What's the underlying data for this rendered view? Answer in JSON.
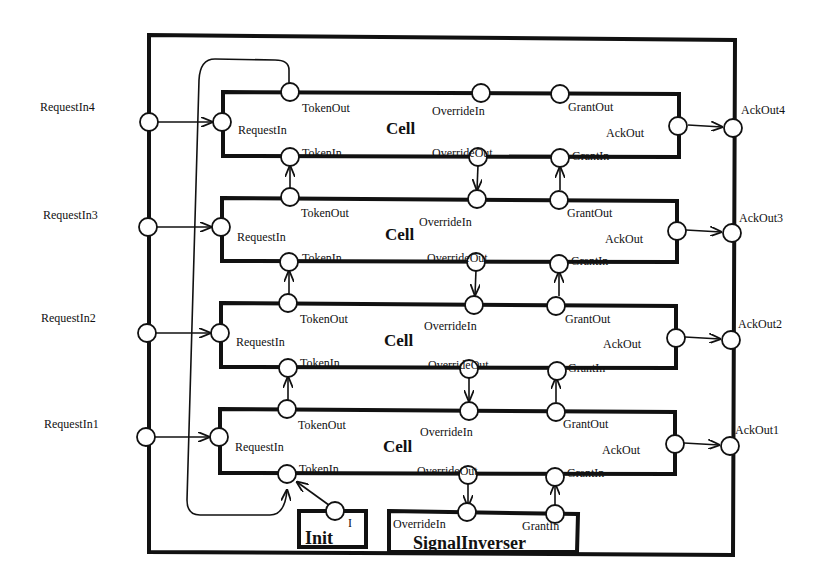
{
  "diagram": {
    "outer_ports_left": [
      "RequestIn4",
      "RequestIn3",
      "RequestIn2",
      "RequestIn1"
    ],
    "outer_ports_right": [
      "AckOut4",
      "AckOut3",
      "AckOut2",
      "AckOut1"
    ],
    "cells": [
      {
        "title": "Cell",
        "ports": {
          "token_out": "TokenOut",
          "override_in": "OverrideIn",
          "grant_out": "GrantOut",
          "request_in": "RequestIn",
          "ack_out": "AckOut",
          "token_in": "TokenIn",
          "override_out": "OverrideOut",
          "grant_in": "GrantIn"
        }
      },
      {
        "title": "Cell",
        "ports": {
          "token_out": "TokenOut",
          "override_in": "OverrideIn",
          "grant_out": "GrantOut",
          "request_in": "RequestIn",
          "ack_out": "AckOut",
          "token_in": "TokenIn",
          "override_out": "OverrideOut",
          "grant_in": "GrantIn"
        }
      },
      {
        "title": "Cell",
        "ports": {
          "token_out": "TokenOut",
          "override_in": "OverrideIn",
          "grant_out": "GrantOut",
          "request_in": "RequestIn",
          "ack_out": "AckOut",
          "token_in": "TokenIn",
          "override_out": "OverrideOut",
          "grant_in": "GrantIn"
        }
      },
      {
        "title": "Cell",
        "ports": {
          "token_out": "TokenOut",
          "override_in": "OverrideIn",
          "grant_out": "GrantOut",
          "request_in": "RequestIn",
          "ack_out": "AckOut",
          "token_in": "TokenIn",
          "override_out": "OverrideOut",
          "grant_in": "GrantIn"
        }
      }
    ],
    "init": {
      "title": "Init",
      "superscript": "I"
    },
    "signal_inverser": {
      "title": "SignalInverser",
      "ports": {
        "override_in": "OverrideIn",
        "grant_in": "GrantIn"
      }
    }
  }
}
